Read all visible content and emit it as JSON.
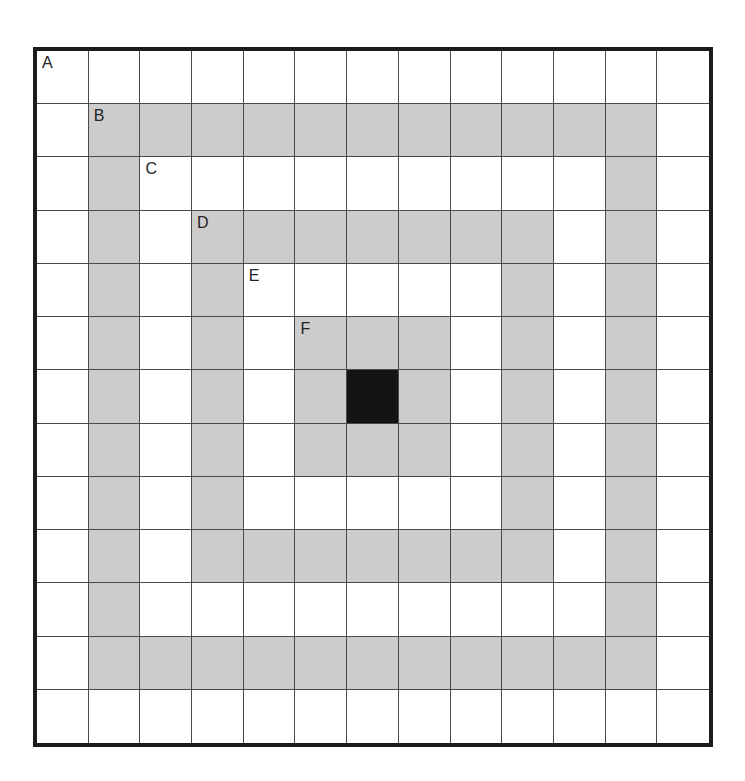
{
  "figure": {
    "grid_size": 13,
    "colors": {
      "white": "#ffffff",
      "gray": "#cccccc",
      "black": "#141414",
      "grid_line": "#4a4a4a",
      "border": "#1c1c1c"
    },
    "rings": [
      {
        "label": "A",
        "ring": 0,
        "fill": "white"
      },
      {
        "label": "B",
        "ring": 1,
        "fill": "gray"
      },
      {
        "label": "C",
        "ring": 2,
        "fill": "white"
      },
      {
        "label": "D",
        "ring": 3,
        "fill": "gray"
      },
      {
        "label": "E",
        "ring": 4,
        "fill": "white"
      },
      {
        "label": "F",
        "ring": 5,
        "fill": "gray"
      },
      {
        "label": "",
        "ring": 6,
        "fill": "black"
      }
    ]
  }
}
